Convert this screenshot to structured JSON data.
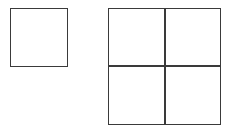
{
  "diagram": {
    "stroke_color": "#3a3a3a",
    "stroke_width": 1.5,
    "background": "#ffffff",
    "shapes": [
      {
        "name": "single-square",
        "type": "square",
        "x": 10,
        "y": 8,
        "width": 58,
        "height": 59,
        "cells": 1
      },
      {
        "name": "grid-2x2",
        "type": "grid",
        "x": 108,
        "y": 8,
        "width": 113,
        "height": 117,
        "rows": 2,
        "cols": 2,
        "divider_x": 165,
        "divider_y": 66
      }
    ]
  }
}
